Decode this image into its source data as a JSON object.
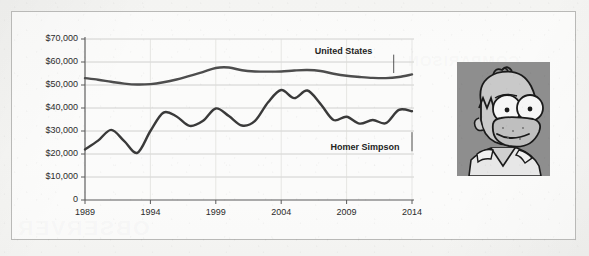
{
  "figure": {
    "ghost_text": "OBSERVER",
    "ghost_text_small": "COMPARISON"
  },
  "photo": {
    "alt_name": "homer-simpson-portrait",
    "bg_color": "#8e8e8e",
    "skin_color": "#c9c9c9"
  },
  "chart_data": {
    "type": "line",
    "title": "",
    "subtitle": "",
    "xlabel": "",
    "ylabel": "",
    "grid": true,
    "legend_position": "inline-annotation",
    "xlim": [
      1989,
      2014
    ],
    "ylim": [
      0,
      70000
    ],
    "x_ticks": [
      1989,
      1994,
      1999,
      2004,
      2009,
      2014
    ],
    "x_tick_labels": [
      "1989",
      "1994",
      "1999",
      "2004",
      "2009",
      "2014"
    ],
    "y_ticks": [
      0,
      10000,
      20000,
      30000,
      40000,
      50000,
      60000,
      70000
    ],
    "y_tick_labels": [
      "0",
      "$10,000",
      "$20,000",
      "$30,000",
      "$40,000",
      "$50,000",
      "$60,000",
      "$70,000"
    ],
    "x": [
      1989,
      1990,
      1991,
      1992,
      1993,
      1994,
      1995,
      1996,
      1997,
      1998,
      1999,
      2000,
      2001,
      2002,
      2003,
      2004,
      2005,
      2006,
      2007,
      2008,
      2009,
      2010,
      2011,
      2012,
      2013,
      2014
    ],
    "series": [
      {
        "name": "United States",
        "color": "#4d4d4d",
        "label_x": 2009.2,
        "label_y": 64500,
        "leader_to": [
          2012.6,
          55200
        ],
        "values": [
          53000,
          52300,
          51400,
          50600,
          50200,
          50400,
          51200,
          52400,
          54000,
          55600,
          57400,
          57600,
          56400,
          55900,
          55800,
          55900,
          56300,
          56500,
          56100,
          54900,
          54000,
          53500,
          53100,
          53000,
          53500,
          54600
        ]
      },
      {
        "name": "Homer Simpson",
        "color": "#3a3a3a",
        "label_x": 2010.4,
        "label_y": 22500,
        "leader_to": [
          2014,
          29500
        ],
        "values": [
          22000,
          25800,
          30500,
          25600,
          20500,
          30000,
          38000,
          36300,
          32200,
          34300,
          39800,
          36500,
          32400,
          34400,
          42500,
          47800,
          44300,
          47600,
          41800,
          34800,
          36200,
          33200,
          34800,
          33400,
          39200,
          38600
        ]
      }
    ],
    "annotations": [
      {
        "text": "United States",
        "x": 2009.2,
        "y": 64500
      },
      {
        "text": "Homer Simpson",
        "x": 2010.4,
        "y": 22500
      }
    ]
  }
}
